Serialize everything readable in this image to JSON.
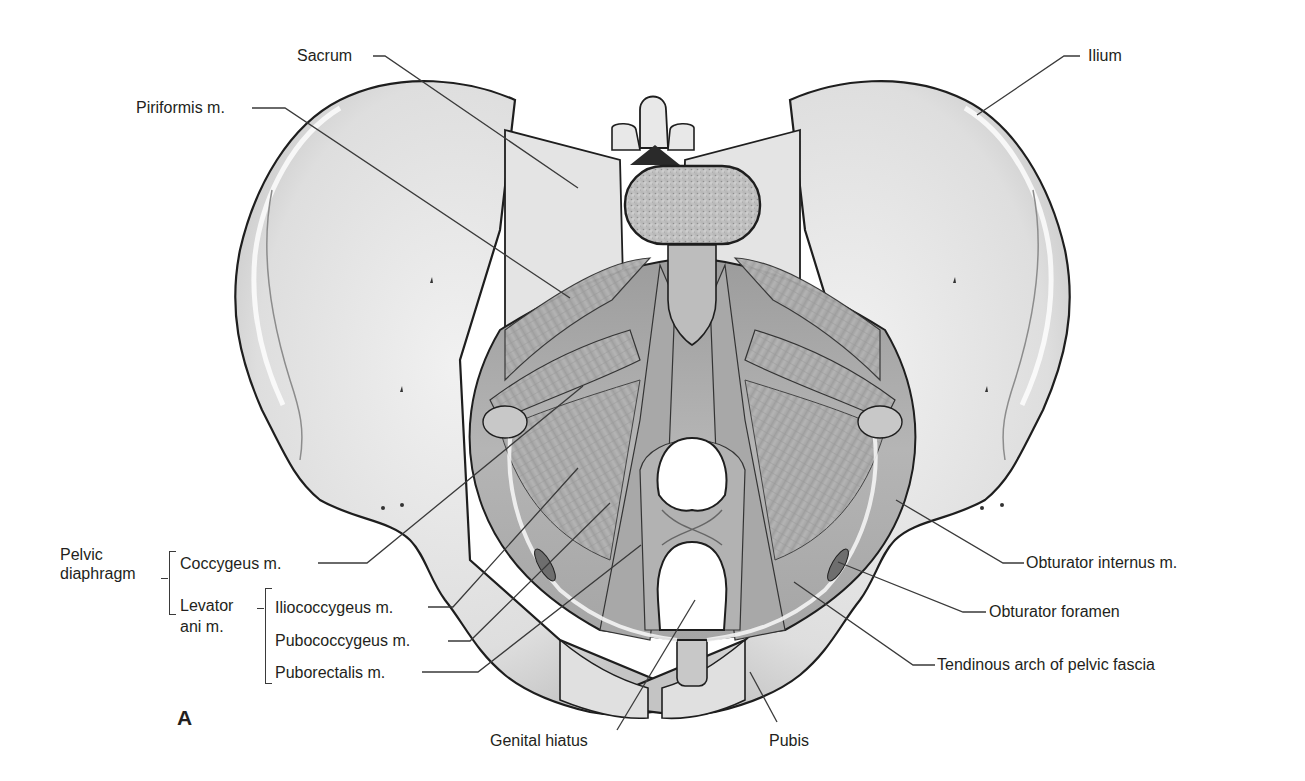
{
  "figure": {
    "panel_letter": "A",
    "colors": {
      "background": "#ffffff",
      "bone_light": "#ececec",
      "bone_mid": "#d4d4d4",
      "muscle": "#b0b0b0",
      "muscle_dark": "#8f8f8f",
      "outline": "#1e1e1e",
      "leader_line": "#3a3a3a",
      "label_text": "#231f20"
    }
  },
  "labels": {
    "sacrum": "Sacrum",
    "piriformis": "Piriformis m.",
    "ilium": "Ilium",
    "pelvic_diaphragm_line1": "Pelvic",
    "pelvic_diaphragm_line2": "diaphragm",
    "coccygeus": "Coccygeus m.",
    "levator_ani_line1": "Levator",
    "levator_ani_line2": "ani m.",
    "iliococcygeus": "Iliococcygeus m.",
    "pubococcygeus": "Pubococcygeus m.",
    "puborectalis": "Puborectalis m.",
    "genital_hiatus": "Genital hiatus",
    "pubis": "Pubis",
    "obturator_internus": "Obturator internus m.",
    "obturator_foramen": "Obturator foramen",
    "tendinous_arch": "Tendinous arch of pelvic fascia"
  },
  "groups": {
    "pelvic_diaphragm": [
      "Coccygeus m.",
      "Levator ani m."
    ],
    "levator_ani": [
      "Iliococcygeus m.",
      "Pubococcygeus m.",
      "Puborectalis m."
    ]
  }
}
